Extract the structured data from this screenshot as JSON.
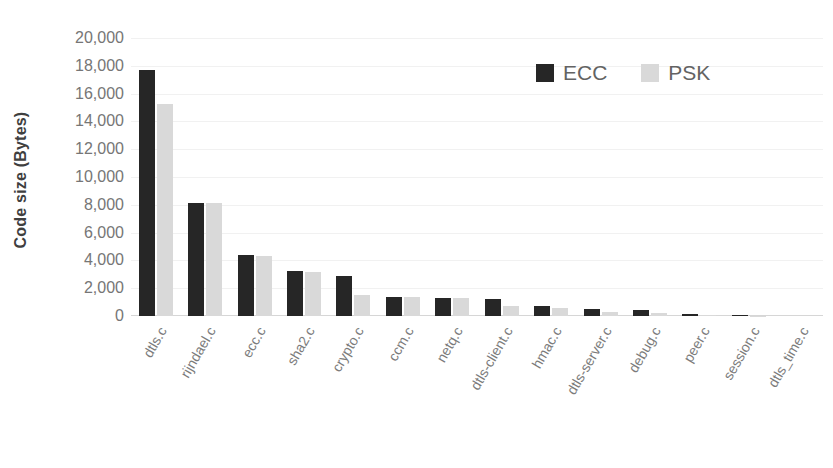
{
  "chart_data": {
    "type": "bar",
    "title": "",
    "xlabel": "",
    "ylabel": "Code size (Bytes)",
    "ylim": [
      0,
      20000
    ],
    "ytick_step": 2000,
    "ytick_labels": [
      "20,000",
      "18,000",
      "16,000",
      "14,000",
      "12,000",
      "10,000",
      "8,000",
      "6,000",
      "4,000",
      "2,000",
      "0"
    ],
    "ytick_values": [
      20000,
      18000,
      16000,
      14000,
      12000,
      10000,
      8000,
      6000,
      4000,
      2000,
      0
    ],
    "grid": true,
    "legend_position": "top-right",
    "categories": [
      "dtls.c",
      "rijndael.c",
      "ecc.c",
      "sha2.c",
      "crypto.c",
      "ccm.c",
      "netq.c",
      "dtls-client.c",
      "hmac.c",
      "dtls-server.c",
      "debug.c",
      "peer.c",
      "session.c",
      "dtls_time.c"
    ],
    "series": [
      {
        "name": "ECC",
        "color": "#262626",
        "values": [
          17700,
          8150,
          4400,
          3250,
          2900,
          1350,
          1300,
          1200,
          700,
          520,
          420,
          150,
          60,
          0
        ]
      },
      {
        "name": "PSK",
        "color": "#d9d9d9",
        "values": [
          15250,
          8100,
          4350,
          3200,
          1500,
          1350,
          1300,
          700,
          600,
          300,
          250,
          80,
          30,
          0
        ]
      }
    ]
  },
  "legend": {
    "items": [
      {
        "label": "ECC",
        "color": "#262626"
      },
      {
        "label": "PSK",
        "color": "#d9d9d9"
      }
    ]
  },
  "axis": {
    "y_title": "Code size (Bytes)"
  }
}
